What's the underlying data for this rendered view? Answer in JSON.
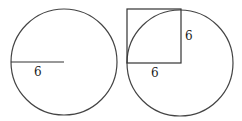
{
  "figures": [
    {
      "name": "circle-with-radius",
      "circle": {
        "cx": 64,
        "cy": 62,
        "r": 53
      },
      "radius_line": {
        "x1": 11,
        "y1": 62,
        "x2": 64,
        "y2": 62
      },
      "labels": [
        {
          "text": "6",
          "x": 34,
          "y": 76
        }
      ]
    },
    {
      "name": "circle-with-square",
      "circle": {
        "cx": 180,
        "cy": 63,
        "r": 53
      },
      "square": {
        "x": 127,
        "y": 9,
        "size": 54
      },
      "labels": [
        {
          "text": "6",
          "x": 185,
          "y": 40
        },
        {
          "text": "6",
          "x": 151,
          "y": 77
        }
      ]
    }
  ],
  "stroke_color": "#444444"
}
